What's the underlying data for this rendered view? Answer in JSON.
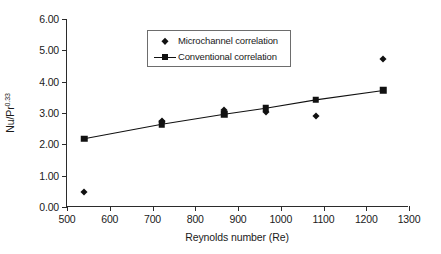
{
  "chart_data": {
    "type": "scatter",
    "title": "",
    "xlabel": "Reynolds number (Re)",
    "ylabel": "Nu/Pr",
    "ylabel_exponent": "0.33",
    "xlim": [
      500,
      1300
    ],
    "ylim": [
      0.0,
      6.0
    ],
    "xticks": [
      500,
      600,
      700,
      800,
      900,
      1000,
      1100,
      1200,
      1300
    ],
    "xtick_labels": [
      "500",
      "600",
      "700",
      "800",
      "900",
      "1000",
      "1100",
      "1200",
      "1300"
    ],
    "yticks": [
      0.0,
      1.0,
      2.0,
      3.0,
      4.0,
      5.0,
      6.0
    ],
    "ytick_labels": [
      "0.00",
      "1.00",
      "2.00",
      "3.00",
      "4.00",
      "5.00",
      "6.00"
    ],
    "grid": false,
    "legend_position": "upper-center",
    "series": [
      {
        "name": "Microchannel correlation",
        "marker": "diamond",
        "line": false,
        "color": "#111111",
        "points": [
          {
            "x": 540,
            "y": 0.49
          },
          {
            "x": 722,
            "y": 2.76
          },
          {
            "x": 722,
            "y": 2.7
          },
          {
            "x": 868,
            "y": 3.08
          },
          {
            "x": 965,
            "y": 3.02
          },
          {
            "x": 1082,
            "y": 2.9
          },
          {
            "x": 1240,
            "y": 4.73
          }
        ]
      },
      {
        "name": "Conventional correlation",
        "marker": "square",
        "line": true,
        "color": "#111111",
        "points": [
          {
            "x": 540,
            "y": 2.18
          },
          {
            "x": 722,
            "y": 2.64
          },
          {
            "x": 868,
            "y": 2.96
          },
          {
            "x": 965,
            "y": 3.15
          },
          {
            "x": 1082,
            "y": 3.42
          },
          {
            "x": 1240,
            "y": 3.72
          }
        ]
      }
    ]
  },
  "legend": {
    "entries": [
      {
        "label": "Microchannel correlation",
        "marker": "diamond",
        "line": false
      },
      {
        "label": "Conventional correlation",
        "marker": "square",
        "line": true
      }
    ]
  }
}
